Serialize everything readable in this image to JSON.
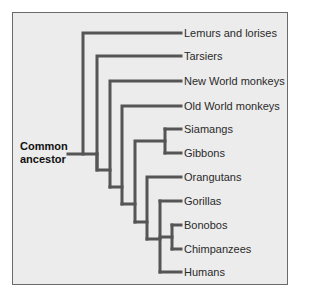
{
  "diagram": {
    "type": "phylogenetic-tree",
    "root_label": [
      "Common",
      "ancestor"
    ],
    "line_color": "#555555",
    "background_color": "#ececec",
    "leaves": [
      {
        "label": "Lemurs and lorises",
        "y": 33
      },
      {
        "label": "Tarsiers",
        "y": 56
      },
      {
        "label": "New World monkeys",
        "y": 81
      },
      {
        "label": "Old World monkeys",
        "y": 106
      },
      {
        "label": "Siamangs",
        "y": 129
      },
      {
        "label": "Gibbons",
        "y": 153
      },
      {
        "label": "Orangutans",
        "y": 177
      },
      {
        "label": "Gorillas",
        "y": 201
      },
      {
        "label": "Bonobos",
        "y": 225
      },
      {
        "label": "Chimpanzees",
        "y": 249
      },
      {
        "label": "Humans",
        "y": 272
      }
    ]
  }
}
